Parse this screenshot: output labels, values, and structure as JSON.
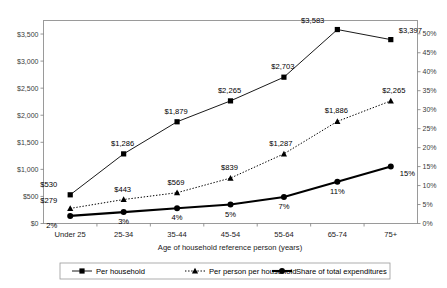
{
  "chart_data": {
    "type": "line",
    "title": "",
    "xlabel": "Age of household reference person (years)",
    "ylabel": "",
    "categories": [
      "Under 25",
      "25-34",
      "35-44",
      "45-54",
      "55-64",
      "65-74",
      "75+"
    ],
    "grid": false,
    "legend_position": "bottom",
    "axes": {
      "left": {
        "ticks": [
          "$0",
          "$500",
          "$1,000",
          "$1,500",
          "$2,000",
          "$2,500",
          "$3,000",
          "$3,500"
        ],
        "values": [
          0,
          500,
          1000,
          1500,
          2000,
          2500,
          3000,
          3500
        ],
        "min": 0,
        "max": 3750
      },
      "right": {
        "ticks": [
          "0%",
          "5%",
          "10%",
          "15%",
          "20%",
          "25%",
          "30%",
          "35%",
          "40%",
          "45%",
          "50%"
        ],
        "values": [
          0,
          5,
          10,
          15,
          20,
          25,
          30,
          35,
          40,
          45,
          50
        ],
        "min": 0,
        "max": 53.5
      }
    },
    "series": [
      {
        "name": "Per household",
        "axis": "left",
        "marker": "square",
        "line_style": "solid",
        "color": "#000000",
        "values": [
          530,
          1286,
          1879,
          2265,
          2703,
          3583,
          3397
        ],
        "labels": [
          "$530",
          "$1,286",
          "$1,879",
          "$2,265",
          "$2,703",
          "$3,583",
          "$3,397"
        ]
      },
      {
        "name": "Per person per household",
        "axis": "left",
        "marker": "triangle",
        "line_style": "dotted",
        "color": "#000000",
        "values": [
          279,
          443,
          569,
          839,
          1287,
          1886,
          2265
        ],
        "labels": [
          "$279",
          "$443",
          "$569",
          "$839",
          "$1,287",
          "$1,886",
          "$2,265"
        ]
      },
      {
        "name": "Share of total expenditures",
        "axis": "right",
        "marker": "circle",
        "line_style": "thick-solid",
        "color": "#000000",
        "values": [
          2,
          3,
          4,
          5,
          7,
          11,
          15
        ],
        "labels": [
          "2%",
          "3%",
          "4%",
          "5%",
          "7%",
          "11%",
          "15%"
        ]
      }
    ]
  },
  "legend": {
    "items": [
      {
        "label": "Per household",
        "marker": "square"
      },
      {
        "label": "Per person per household",
        "marker": "triangle"
      },
      {
        "label": "Share of total expenditures",
        "marker": "circle"
      }
    ]
  }
}
